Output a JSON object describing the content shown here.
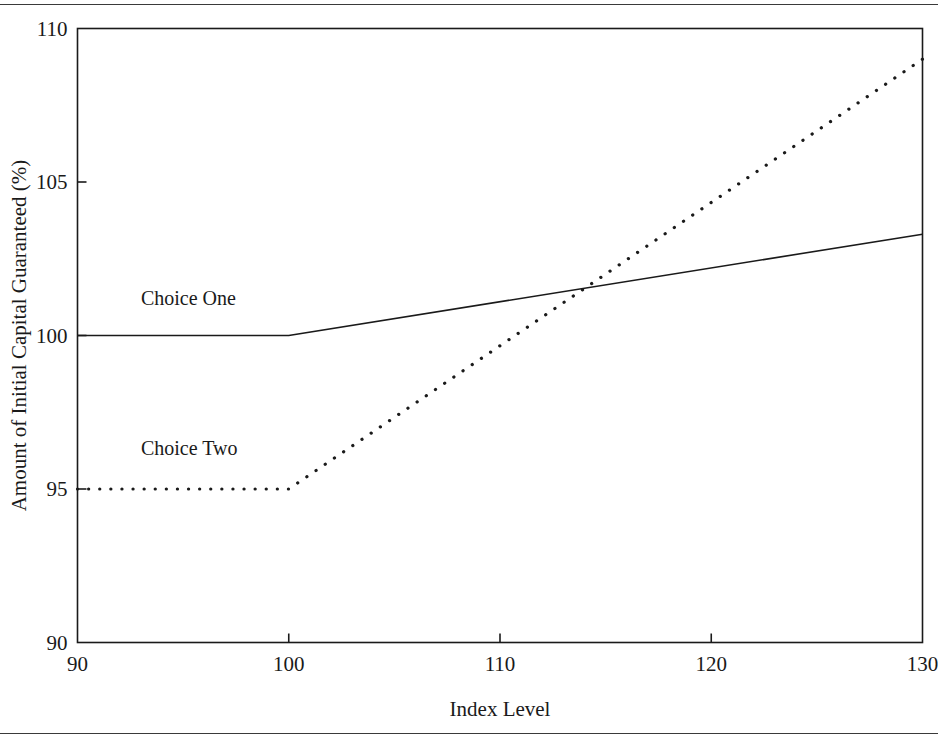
{
  "figure": {
    "background_color": "#ffffff",
    "ink_color": "#1a1a1a",
    "top_rule": "",
    "bottom_rule": ""
  },
  "chart_data": {
    "type": "line",
    "title": "",
    "xlabel": "Index Level",
    "ylabel": "Amount of Initial Capital Guaranteed (%)",
    "xlim": [
      90,
      130
    ],
    "ylim": [
      90,
      110
    ],
    "xticks": [
      90,
      100,
      110,
      120,
      130
    ],
    "xticklabels": [
      "90",
      "100",
      "110",
      "120",
      "130"
    ],
    "yticks": [
      90,
      95,
      100,
      105,
      110
    ],
    "yticklabels": [
      "90",
      "95",
      "100",
      "105",
      "110"
    ],
    "grid": false,
    "legend_position": "inline-annotations",
    "series": [
      {
        "name": "Choice One",
        "linestyle": "solid",
        "color": "#1a1a1a",
        "linewidth": 1.6,
        "x": [
          90,
          100,
          130
        ],
        "values": [
          100,
          100,
          103.3
        ],
        "annotation": {
          "text": "Choice One",
          "x": 93,
          "y": 101.0
        }
      },
      {
        "name": "Choice Two",
        "linestyle": "dotted",
        "color": "#1a1a1a",
        "linewidth": 3.2,
        "x": [
          90,
          100,
          130
        ],
        "values": [
          95,
          95,
          109.0
        ],
        "annotation": {
          "text": "Choice Two",
          "x": 93,
          "y": 96.1
        }
      }
    ],
    "intersection": {
      "x": 113.4,
      "y": 101.4
    }
  }
}
